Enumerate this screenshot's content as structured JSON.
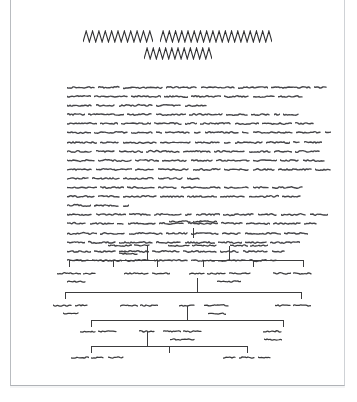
{
  "page": {
    "kind": "scanned-document-page",
    "background_color": "#ffffff",
    "border_color": "#b9bcc0",
    "ink_color": "#3a3a3c",
    "width": 335,
    "height": 386,
    "offset_left": 10
  },
  "title": {
    "name": "document-title",
    "render_style": "zigzag-greeked-text",
    "stroke_color": "#2f2f31",
    "lines": [
      {
        "words": [
          {
            "cycles": 11,
            "width": 70,
            "height": 13
          },
          {
            "cycles": 18,
            "width": 112,
            "height": 13
          }
        ]
      },
      {
        "words": [
          {
            "cycles": 11,
            "width": 68,
            "height": 13
          }
        ]
      }
    ]
  },
  "body": {
    "name": "document-body-text",
    "render_style": "squiggle-greeked-text",
    "stroke_color": "#46464a",
    "line_height": 9.1,
    "block_width": 248,
    "lines": [
      {
        "words": [
          28,
          22,
          40,
          32,
          34,
          30,
          40,
          14
        ]
      },
      {
        "words": [
          24,
          34,
          30,
          24,
          30,
          26,
          22,
          26
        ]
      },
      {
        "words": [
          26,
          20,
          34,
          26,
          22
        ]
      },
      {
        "words": [
          18,
          36,
          26,
          30,
          34,
          22,
          20,
          6,
          16
        ]
      },
      {
        "words": [
          30,
          18,
          30,
          28,
          12,
          32,
          24,
          30,
          20
        ]
      },
      {
        "words": [
          24,
          34,
          22,
          6,
          26,
          8,
          34,
          8,
          40,
          26,
          6
        ]
      },
      {
        "words": [
          30,
          20,
          34,
          32,
          26,
          8,
          28,
          24,
          8,
          18
        ]
      },
      {
        "words": [
          26,
          20,
          24,
          34,
          28,
          32,
          22,
          18,
          26
        ]
      },
      {
        "words": [
          28,
          34,
          24,
          26,
          22,
          34,
          24,
          20,
          22
        ]
      },
      {
        "words": [
          26,
          36,
          20,
          32,
          28,
          26,
          22,
          34,
          16
        ]
      },
      {
        "words": [
          22,
          28,
          32,
          26,
          14
        ]
      },
      {
        "words": [
          30,
          24,
          28,
          20,
          40,
          26,
          16,
          32
        ]
      },
      {
        "words": [
          28,
          22,
          34,
          24,
          30,
          26,
          30,
          20
        ]
      },
      {
        "words": [
          24,
          26,
          6
        ]
      },
      {
        "words": [
          26,
          30,
          22,
          28,
          8,
          24,
          32,
          20,
          26,
          18
        ]
      },
      {
        "words": [
          20,
          24,
          8,
          28,
          26,
          30,
          22,
          24,
          28,
          14
        ]
      },
      {
        "words": [
          30,
          26,
          34,
          22,
          28,
          20,
          36,
          24
        ]
      },
      {
        "words": [
          18,
          28,
          34,
          26,
          30,
          24,
          22,
          30
        ]
      },
      {
        "words": [
          24,
          22,
          30,
          28,
          34,
          20,
          26,
          14
        ]
      },
      {
        "words": [
          22,
          30,
          26,
          34,
          24,
          28,
          18,
          8
        ]
      }
    ]
  },
  "tree": {
    "name": "hierarchy-tree-diagram",
    "render_style": "squiggle-greeked-labels",
    "line_color": "#3c3c3e",
    "levels": 5,
    "nodes": [
      {
        "id": "root",
        "level": 0,
        "x": 172,
        "y": 6,
        "label_rows": [
          [
            22,
            24
          ]
        ]
      },
      {
        "id": "n1-1",
        "level": 1,
        "x": 108,
        "y": 30,
        "label_rows": [
          [
            24,
            16
          ],
          [
            20
          ]
        ]
      },
      {
        "id": "n1-2",
        "level": 1,
        "x": 172,
        "y": 30,
        "label_rows": [
          [
            22,
            26
          ]
        ]
      },
      {
        "id": "n1-3",
        "level": 1,
        "x": 228,
        "y": 30,
        "label_rows": [
          [
            18,
            18
          ]
        ]
      },
      {
        "id": "n2-1",
        "level": 2,
        "x": 56,
        "y": 58,
        "label_rows": [
          [
            24,
            14
          ],
          [
            20
          ]
        ]
      },
      {
        "id": "n2-2",
        "level": 2,
        "x": 126,
        "y": 58,
        "label_rows": [
          [
            26,
            18
          ]
        ]
      },
      {
        "id": "n2-3",
        "level": 2,
        "x": 176,
        "y": 58,
        "label_rows": [
          [
            16
          ]
        ]
      },
      {
        "id": "n2-4",
        "level": 2,
        "x": 208,
        "y": 58,
        "label_rows": [
          [
            20,
            22
          ],
          [
            24
          ]
        ]
      },
      {
        "id": "n2-5",
        "level": 2,
        "x": 272,
        "y": 58,
        "label_rows": [
          [
            18,
            20
          ]
        ]
      },
      {
        "id": "n3-1",
        "level": 3,
        "x": 50,
        "y": 90,
        "label_rows": [
          [
            20,
            14
          ],
          [
            16
          ]
        ]
      },
      {
        "id": "n3-2",
        "level": 3,
        "x": 118,
        "y": 90,
        "label_rows": [
          [
            18,
            18
          ]
        ]
      },
      {
        "id": "n3-3",
        "level": 3,
        "x": 166,
        "y": 90,
        "label_rows": [
          [
            16
          ]
        ]
      },
      {
        "id": "n3-4",
        "level": 3,
        "x": 196,
        "y": 90,
        "label_rows": [
          [
            26
          ],
          [
            18
          ]
        ]
      },
      {
        "id": "n3-5",
        "level": 3,
        "x": 272,
        "y": 90,
        "label_rows": [
          [
            16,
            18
          ]
        ]
      },
      {
        "id": "n4-1",
        "level": 4,
        "x": 78,
        "y": 116,
        "label_rows": [
          [
            16,
            20
          ]
        ]
      },
      {
        "id": "n4-2",
        "level": 4,
        "x": 126,
        "y": 116,
        "label_rows": [
          [
            16
          ]
        ]
      },
      {
        "id": "n4-3",
        "level": 4,
        "x": 162,
        "y": 116,
        "label_rows": [
          [
            18,
            20
          ],
          [
            26
          ]
        ]
      },
      {
        "id": "n4-4",
        "level": 4,
        "x": 252,
        "y": 116,
        "label_rows": [
          [
            20
          ],
          [
            18
          ]
        ]
      },
      {
        "id": "n5-1",
        "level": 5,
        "x": 76,
        "y": 142,
        "label_rows": [
          [
            18,
            14,
            16
          ]
        ]
      },
      {
        "id": "n5-2",
        "level": 5,
        "x": 226,
        "y": 142,
        "label_rows": [
          [
            14,
            16,
            14
          ]
        ]
      }
    ],
    "connectors": [
      {
        "from": "root",
        "drop_to_y": 26
      },
      {
        "from": "n1-1",
        "bus_y": 48,
        "bus_x1": 48,
        "bus_x2": 136,
        "stem_x": 126
      },
      {
        "from": "n1-3",
        "bus_y": 48,
        "bus_x1": 182,
        "bus_x2": 282,
        "stem_x": 208
      },
      {
        "from": "n2-3",
        "bus_y": 80,
        "bus_x1": 44,
        "bus_x2": 280,
        "stem_x": 176
      },
      {
        "from": "n3-3",
        "bus_y": 108,
        "bus_x1": 70,
        "bus_x2": 262,
        "stem_x": 166
      },
      {
        "from": "n4-2",
        "bus_y": 134,
        "bus_x1": 70,
        "bus_x2": 226,
        "stem_x": 126
      }
    ]
  }
}
